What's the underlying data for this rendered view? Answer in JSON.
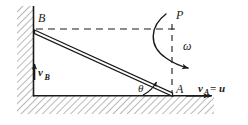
{
  "figure": {
    "type": "physics-mechanics-diagram",
    "background_color": "#ffffff",
    "line_color": "#1a1a1a",
    "hatch_color": "#9a9a9a",
    "labels": {
      "point_b": "B",
      "point_a": "A",
      "point_p": "P",
      "omega": "ω",
      "theta": "θ",
      "velocity_b": "v",
      "velocity_b_sub": "B",
      "velocity_a": "v",
      "velocity_a_sub": "A",
      "velocity_a_equals": "= u"
    },
    "geometry": {
      "wall_x": 33,
      "ground_y": 96,
      "point_b": [
        34,
        29
      ],
      "point_a": [
        172,
        95
      ],
      "point_p": [
        168,
        18
      ],
      "ground_right_end": 214,
      "wall_top": 6,
      "dashed_horizontal_y": 29,
      "dashed_vertical_x": 172,
      "rod_thickness": 4
    }
  }
}
